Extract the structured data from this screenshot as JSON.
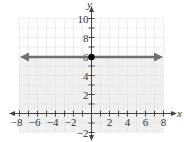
{
  "chart_data": {
    "type": "line",
    "title": "",
    "xlabel": "x",
    "ylabel": "y",
    "xlim": [
      -8,
      8
    ],
    "ylim": [
      -2,
      10
    ],
    "grid": true,
    "x_ticks": [
      "-8",
      "-6",
      "-4",
      "-2",
      "2",
      "4",
      "6",
      "8"
    ],
    "y_ticks": [
      "-2",
      "2",
      "4",
      "6",
      "8",
      "10"
    ],
    "series": [
      {
        "name": "y = 6",
        "kind": "horizontal line with arrows both ends",
        "y": 6,
        "x_range": [
          -8,
          8
        ],
        "color": "#707070"
      }
    ],
    "points": [
      {
        "x": 0,
        "y": 6,
        "style": "filled",
        "color": "#000000"
      }
    ],
    "shaded_region": {
      "description": "y < 6 (below line)",
      "color": "#f0f0f0"
    }
  },
  "colors": {
    "grid": "#e2e2e2",
    "axis": "#444444",
    "line": "#707070",
    "shade": "#f0f0f0"
  }
}
